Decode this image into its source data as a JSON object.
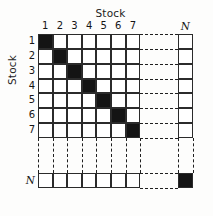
{
  "figure": {
    "top_axis_title": "Stock",
    "left_axis_title": "Stock",
    "column_labels": [
      "1",
      "2",
      "3",
      "4",
      "5",
      "6",
      "7"
    ],
    "column_label_last": "N",
    "row_labels": [
      "1",
      "2",
      "3",
      "4",
      "5",
      "6",
      "7"
    ],
    "row_label_last": "N",
    "fill_color": "#141414",
    "empty_color": "#ffffff",
    "line_color": "#2b2b2b",
    "dash_color": "#1f1f1f"
  },
  "chart_data": {
    "type": "heatmap",
    "title": "Stock",
    "xlabel": "Stock",
    "ylabel": "Stock",
    "categories": [
      "1",
      "2",
      "3",
      "4",
      "5",
      "6",
      "7",
      "N"
    ],
    "x": [
      "1",
      "2",
      "3",
      "4",
      "5",
      "6",
      "7",
      "N"
    ],
    "y": [
      "1",
      "2",
      "3",
      "4",
      "5",
      "6",
      "7",
      "N"
    ],
    "legend": [],
    "grid": true,
    "note": "N x N matrix with filled (black) cells on the main diagonal and empty (white) cells off-diagonal; rows/columns 8..N-1 elided with dashed lines",
    "values": [
      [
        1,
        0,
        0,
        0,
        0,
        0,
        0,
        0
      ],
      [
        0,
        1,
        0,
        0,
        0,
        0,
        0,
        0
      ],
      [
        0,
        0,
        1,
        0,
        0,
        0,
        0,
        0
      ],
      [
        0,
        0,
        0,
        1,
        0,
        0,
        0,
        0
      ],
      [
        0,
        0,
        0,
        0,
        1,
        0,
        0,
        0
      ],
      [
        0,
        0,
        0,
        0,
        0,
        1,
        0,
        0
      ],
      [
        0,
        0,
        0,
        0,
        0,
        0,
        1,
        0
      ],
      [
        0,
        0,
        0,
        0,
        0,
        0,
        0,
        1
      ]
    ]
  }
}
